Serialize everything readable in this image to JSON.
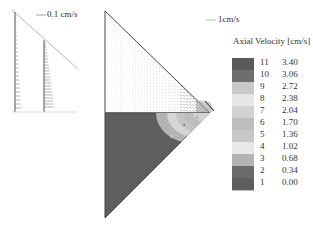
{
  "left_panel": {
    "scale_label": "0.1 cm/s",
    "profiles": [
      "near-wall profile",
      "mid-radius profile"
    ]
  },
  "main_panel": {
    "scale_label": "1cm/s",
    "regions": [
      "velocity-vector-field",
      "axial-velocity-contour"
    ]
  },
  "legend": {
    "title": "Axial Velocity [cm/s]",
    "levels": [
      {
        "index": "11",
        "value": "3.40",
        "color": "#5a5a5a"
      },
      {
        "index": "10",
        "value": "3.06",
        "color": "#6e6e6e"
      },
      {
        "index": "9",
        "value": "2.72",
        "color": "#c8c8c8"
      },
      {
        "index": "8",
        "value": "2.38",
        "color": "#e6e6e6"
      },
      {
        "index": "7",
        "value": "2.04",
        "color": "#d2d2d2"
      },
      {
        "index": "6",
        "value": "1.70",
        "color": "#bebebe"
      },
      {
        "index": "5",
        "value": "1.36",
        "color": "#c8c8c8"
      },
      {
        "index": "4",
        "value": "1.02",
        "color": "#e8e8e8"
      },
      {
        "index": "3",
        "value": "0.68",
        "color": "#b4b4b4"
      },
      {
        "index": "2",
        "value": "0.34",
        "color": "#6a6a6a"
      },
      {
        "index": "1",
        "value": "0.00",
        "color": "#5e5e5e"
      }
    ]
  }
}
